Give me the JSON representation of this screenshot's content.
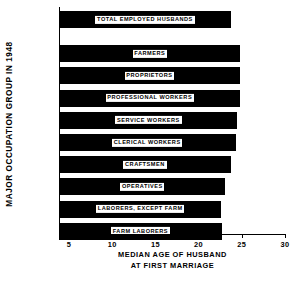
{
  "chart_data": {
    "type": "bar",
    "orientation": "horizontal",
    "title": "",
    "xlabel": "MEDIAN AGE OF HUSBAND AT FIRST MARRIAGE",
    "xlabel_line1": "MEDIAN  AGE  OF  HUSBAND",
    "xlabel_line2": "AT  FIRST  MARRIAGE",
    "ylabel": "MAJOR  OCCUPATION  GROUP  IN  1948",
    "xlim": [
      2.5,
      30.5
    ],
    "xticks": [
      5,
      10,
      15,
      20,
      25,
      30
    ],
    "xtick_labels": [
      "5",
      "10",
      "15",
      "20",
      "25",
      "30"
    ],
    "grid": false,
    "legend": false,
    "bar_color": "#000000",
    "label_bg_color": "#ffffff",
    "label_text_color": "#000000",
    "axis_color": "#000000",
    "background_color": "#ffffff",
    "categories": [
      "TOTAL  EMPLOYED  HUSBANDS",
      "FARMERS",
      "PROPRIETORS",
      "PROFESSIONAL  WORKERS",
      "SERVICE  WORKERS",
      "CLERICAL  WORKERS",
      "CRAFTSMEN",
      "OPERATIVES",
      "LABORERS, EXCEPT FARM",
      "FARM  LABORERS"
    ],
    "values": [
      23.7,
      24.8,
      24.8,
      24.8,
      24.5,
      24.3,
      23.7,
      23.1,
      22.6,
      22.7
    ]
  },
  "bars": [
    {
      "label": "TOTAL  EMPLOYED  HUSBANDS",
      "value": 23.7
    },
    {
      "label": "FARMERS",
      "value": 24.8
    },
    {
      "label": "PROPRIETORS",
      "value": 24.8
    },
    {
      "label": "PROFESSIONAL  WORKERS",
      "value": 24.8
    },
    {
      "label": "SERVICE  WORKERS",
      "value": 24.5
    },
    {
      "label": "CLERICAL  WORKERS",
      "value": 24.3
    },
    {
      "label": "CRAFTSMEN",
      "value": 23.7
    },
    {
      "label": "OPERATIVES",
      "value": 23.1
    },
    {
      "label": "LABORERS, EXCEPT FARM",
      "value": 22.6
    },
    {
      "label": "FARM  LABORERS",
      "value": 22.7
    }
  ],
  "axis": {
    "ylabel": "MAJOR  OCCUPATION  GROUP  IN  1948",
    "xlabel_line1": "MEDIAN  AGE  OF  HUSBAND",
    "xlabel_line2": "AT  FIRST  MARRIAGE",
    "tick_labels": [
      "5",
      "10",
      "15",
      "20",
      "25",
      "30"
    ]
  }
}
